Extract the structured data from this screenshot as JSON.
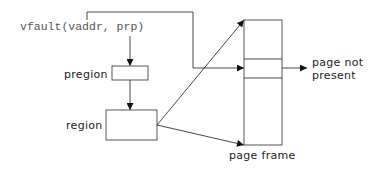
{
  "diagram": {
    "call_label": "vfault(vaddr, prp)",
    "nodes": {
      "pregion": {
        "label": "pregion"
      },
      "region": {
        "label": "region"
      },
      "page_frame": {
        "label": "page frame"
      }
    },
    "outcome": {
      "line1": "page not",
      "line2": "present"
    },
    "edges": [
      {
        "from": "vfault(vaddr, prp)",
        "to": "pregion"
      },
      {
        "from": "pregion",
        "to": "region"
      },
      {
        "from": "region",
        "to": "page frame (top)"
      },
      {
        "from": "region",
        "to": "page frame (bottom)"
      },
      {
        "from": "vfault(vaddr, prp)",
        "to": "page frame (entry)"
      },
      {
        "from": "page frame (entry)",
        "to": "page not present"
      }
    ]
  }
}
